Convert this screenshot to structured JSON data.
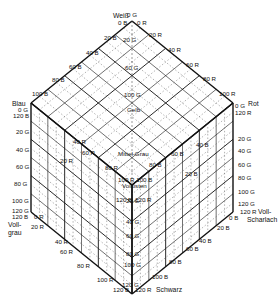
{
  "diagram": {
    "type": "color-cube",
    "divisions": 6,
    "step": 20,
    "max": 120,
    "colors": {
      "line": "#111111",
      "background": "#ffffff",
      "dashed": "#555555"
    },
    "geometry": {
      "top": [
        132,
        21
      ],
      "upper_left": [
        31,
        103
      ],
      "upper_right": [
        233,
        103
      ],
      "center": [
        132,
        185
      ],
      "lower_left": [
        31,
        212
      ],
      "lower_right": [
        233,
        212
      ],
      "bottom": [
        132,
        294
      ]
    },
    "vertices": {
      "top": "Weiß",
      "upper_left": "Blau",
      "upper_right": "Rot",
      "lower_left_line1": "Voll-",
      "lower_left_line2": "grau",
      "lower_right_line1": "Voll-",
      "lower_right_line2": "Scharlach",
      "bottom": "Schwarz",
      "middle": "Mittel-Grau",
      "center_line1": "100 R 100 B",
      "center_line2": "Volltisten",
      "gelb": "Gelb"
    },
    "top_labels": {
      "og_top": "0 G",
      "ob": "0 B",
      "or": "0 R"
    },
    "upper_left_edge": [
      "20 B",
      "40 B",
      "60 B",
      "80 B",
      "100 B"
    ],
    "upper_right_edge": [
      "20 R",
      "40 R",
      "60 R",
      "80 R",
      "100 R"
    ],
    "blau_corner": [
      "0 G",
      "120 B"
    ],
    "rot_corner": [
      "0 G",
      "120 R"
    ],
    "left_vertical": [
      "20 G",
      "40 G",
      "60 G",
      "80 G",
      "100 G"
    ],
    "left_bottom_corner": [
      "120 G",
      "120 B"
    ],
    "right_vertical": [
      "20 G",
      "40 G",
      "60 G",
      "80 G",
      "100 G"
    ],
    "right_bottom_corner": [
      "120 G",
      "120 R"
    ],
    "lower_left_edge": [
      "0 R",
      "20 R",
      "40 R",
      "60 R",
      "80 R",
      "100 R"
    ],
    "lower_right_edge": [
      "0 B",
      "20 B",
      "40 B",
      "60 B",
      "80 B",
      "100 B"
    ],
    "lower_left_start": "0 R",
    "lower_right_start": "0 B",
    "bottom_labels": [
      "120 B",
      "120 G",
      "120 R"
    ],
    "center_vertical": [
      "20 G",
      "40 G",
      "60 G",
      "80 G",
      "100 G"
    ],
    "inner_top_vertical": [
      "20 G",
      "60 G",
      "100 G"
    ],
    "inner_misc": {
      "r20": "20 R",
      "r40": "40 R",
      "r60": "60 R",
      "r80": "80 R",
      "b20": "20 B",
      "b40": "40 B",
      "b60": "60 B",
      "b80": "80 B",
      "center_120b": "120 B",
      "center_120r": "120 R",
      "center_20g": "20 G"
    }
  }
}
